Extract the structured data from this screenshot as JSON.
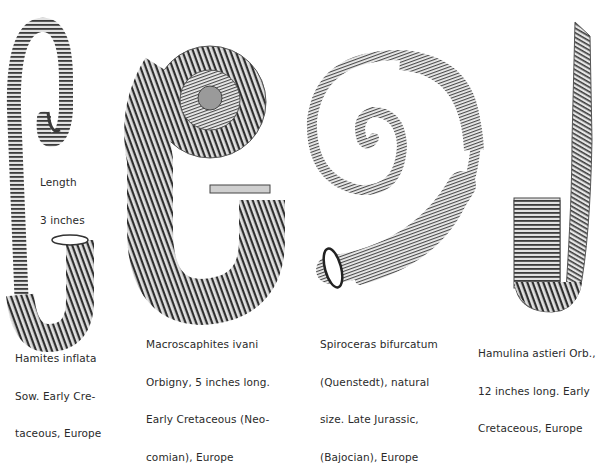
{
  "plate": {
    "specimens": [
      {
        "id": "hamites",
        "name": "Hamites inflata",
        "caption_lines": [
          "Hamites inflata",
          "Sow. Early Cre-",
          "taceous, Europe"
        ],
        "annotation_lines": [
          "Length",
          "3 inches"
        ]
      },
      {
        "id": "macroscaphites",
        "name": "Macroscaphites ivani",
        "caption_lines": [
          "Macroscaphites ivani",
          "Orbigny, 5 inches long.",
          "Early Cretaceous (Neo-",
          "comian), Europe"
        ]
      },
      {
        "id": "spiroceras",
        "name": "Spiroceras bifurcatum",
        "caption_lines": [
          "Spiroceras bifurcatum",
          "(Quenstedt), natural",
          "size. Late Jurassic,",
          "(Bajocian), Europe"
        ]
      },
      {
        "id": "hamulina",
        "name": "Hamulina astieri",
        "caption_lines": [
          "Hamulina astieri Orb.,",
          "12 inches long. Early",
          "Cretaceous, Europe"
        ]
      }
    ],
    "colors": {
      "ink": "#2a2a2a",
      "shell_dark": "#3a3a3a",
      "shell_mid": "#8a8a8a",
      "shell_light": "#d8d8d8",
      "background": "#ffffff"
    }
  }
}
